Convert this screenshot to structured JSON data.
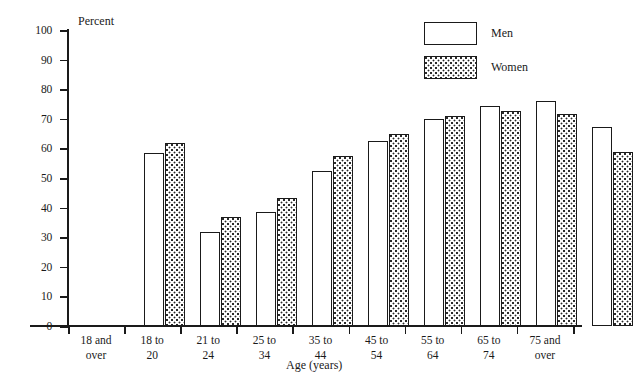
{
  "chart_data": {
    "type": "bar",
    "title": "",
    "xlabel": "Age (years)",
    "ylabel": "Percent",
    "ylim": [
      0,
      100
    ],
    "ytick_step": 10,
    "yticks": [
      100,
      90,
      80,
      70,
      60,
      50,
      40,
      30,
      20,
      10,
      0
    ],
    "grid": false,
    "legend_position": "top-right",
    "categories": [
      "18 and\nover",
      "18 to\n20",
      "21 to\n24",
      "25 to\n34",
      "35 to\n44",
      "45 to\n54",
      "55 to\n64",
      "65 to\n74",
      "75 and\nover"
    ],
    "series": [
      {
        "name": "Men",
        "fill": "white",
        "values": [
          58.4,
          31.8,
          38.5,
          52.4,
          62.5,
          69.8,
          74.2,
          76.0,
          67.4
        ]
      },
      {
        "name": "Women",
        "fill": "stipple",
        "values": [
          61.7,
          36.8,
          43.2,
          57.4,
          64.8,
          70.8,
          72.8,
          71.6,
          58.8
        ]
      }
    ]
  },
  "legend": {
    "items": [
      {
        "label": "Men",
        "swatch": "men"
      },
      {
        "label": "Women",
        "swatch": "women"
      }
    ]
  },
  "colors": {
    "ink": "#1a1a1a",
    "background": "#ffffff",
    "stipple": "#2b2b2b"
  }
}
